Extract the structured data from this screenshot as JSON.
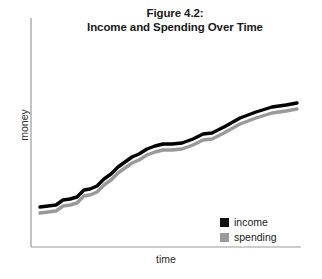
{
  "figure": {
    "title_line_1": "Figure 4.2:",
    "title_line_2": "Income and Spending Over Time"
  },
  "axes": {
    "x_label": "time",
    "y_label": "money",
    "axis_color": "#9a9a9a"
  },
  "legend": {
    "position": "bottom-right",
    "entries": [
      {
        "label": "income",
        "color": "#000000",
        "swatch": "legend-swatch-income"
      },
      {
        "label": "spending",
        "color": "#999999",
        "swatch": "legend-swatch-spending"
      }
    ]
  },
  "chart_data": {
    "type": "line",
    "title": "Figure 4.2: Income and Spending Over Time",
    "xlabel": "time",
    "ylabel": "money",
    "grid": false,
    "legend_position": "bottom-right",
    "axis_ticks": "none",
    "xlim": [
      0,
      100
    ],
    "ylim": [
      0,
      100
    ],
    "x": [
      0,
      4,
      8,
      12,
      16,
      20,
      24,
      28,
      32,
      36,
      40,
      44,
      48,
      52,
      56,
      60,
      64,
      68,
      72,
      76,
      80,
      84,
      88,
      92,
      96,
      100
    ],
    "series": [
      {
        "name": "income",
        "color": "#000000",
        "values": [
          17,
          18,
          19,
          22,
          23,
          24,
          28,
          29,
          31,
          35,
          38,
          42,
          45,
          48,
          50,
          53,
          55,
          56,
          56,
          57,
          60,
          63,
          64,
          68,
          74,
          79
        ]
      },
      {
        "name": "spending",
        "color": "#999999",
        "values": [
          14,
          15,
          16,
          19,
          20,
          21,
          25,
          26,
          28,
          32,
          35,
          39,
          42,
          45,
          47,
          50,
          52,
          53,
          53,
          54,
          57,
          60,
          61,
          65,
          71,
          76
        ]
      }
    ],
    "annotations": []
  },
  "geometry": {
    "income_path": "M 40,207 L 48,206 L 56,205 L 63,200 L 70,199 L 77,197 L 84,190 L 90,189 L 97,186 L 104,179 L 111,174 L 118,167 L 125,162 L 132,157 L 139,154 L 147,149 L 155,146 L 163,144 L 172,144 L 182,143 L 193,139 L 203,134 L 212,133 L 224,127 L 240,118 L 256,112 L 272,107 L 286,105 L 297,103",
    "spending_path": "M 40,213 L 48,212 L 56,211 L 63,206 L 70,205 L 77,203 L 84,196 L 90,195 L 97,192 L 104,185 L 111,180 L 118,173 L 125,168 L 132,163 L 139,160 L 147,155 L 155,152 L 163,150 L 172,150 L 182,149 L 193,145 L 203,140 L 212,139 L 224,133 L 240,124 L 256,118 L 272,113 L 286,111 L 297,109",
    "y_axis": {
      "x": 31,
      "y_top": 18,
      "y_bottom": 247
    },
    "x_axis": {
      "y": 247,
      "x_left": 31,
      "x_right": 301
    }
  }
}
